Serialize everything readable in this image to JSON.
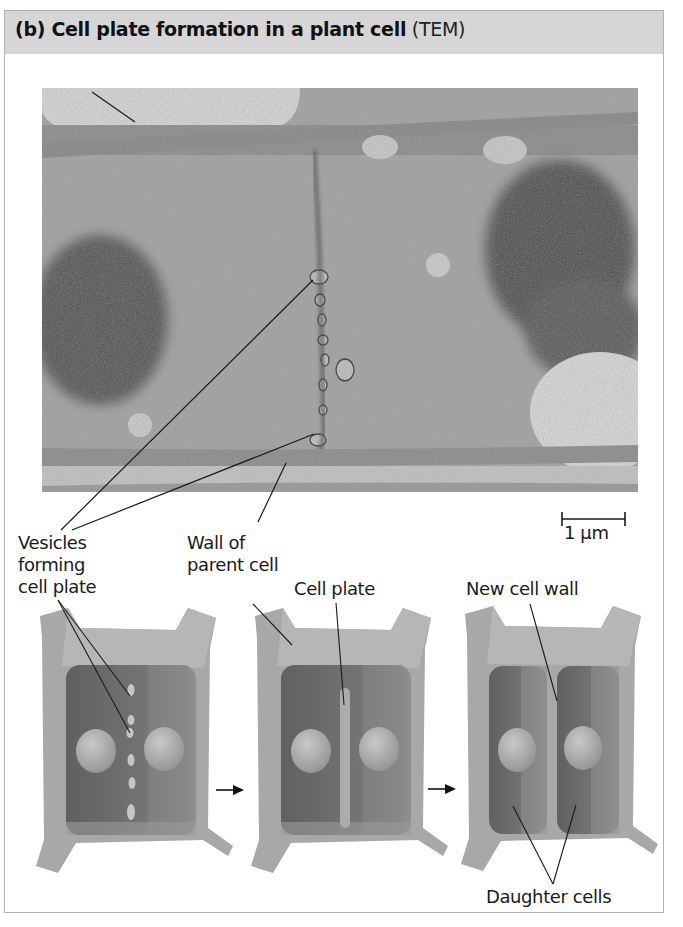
{
  "figure": {
    "title_bold": "(b) Cell plate formation in a plant cell",
    "title_suffix": "(TEM)",
    "micrograph": {
      "type": "TEM",
      "labels": {
        "vesicles_line1": "Vesicles",
        "vesicles_line2": "forming",
        "vesicles_line3": "cell plate",
        "wall_line1": "Wall of",
        "wall_line2": "parent cell"
      },
      "scale_bar": "1 µm"
    },
    "diagram": {
      "stages": [
        {
          "name": "vesicles-stage",
          "label": ""
        },
        {
          "name": "cell-plate-stage",
          "label": "Cell plate"
        },
        {
          "name": "new-wall-stage",
          "label": "New cell wall"
        }
      ],
      "bottom_label": "Daughter cells",
      "arrow_icon": "right-arrow-icon"
    },
    "colors": {
      "header_bg": "#d6d6d6",
      "frame_border": "#b4b4b4",
      "wall": "#a9a9a9",
      "cytoplasm": "#6f6f6f",
      "nucleus": "#b5b5b5",
      "tem_base": "#9c9c9c"
    }
  }
}
